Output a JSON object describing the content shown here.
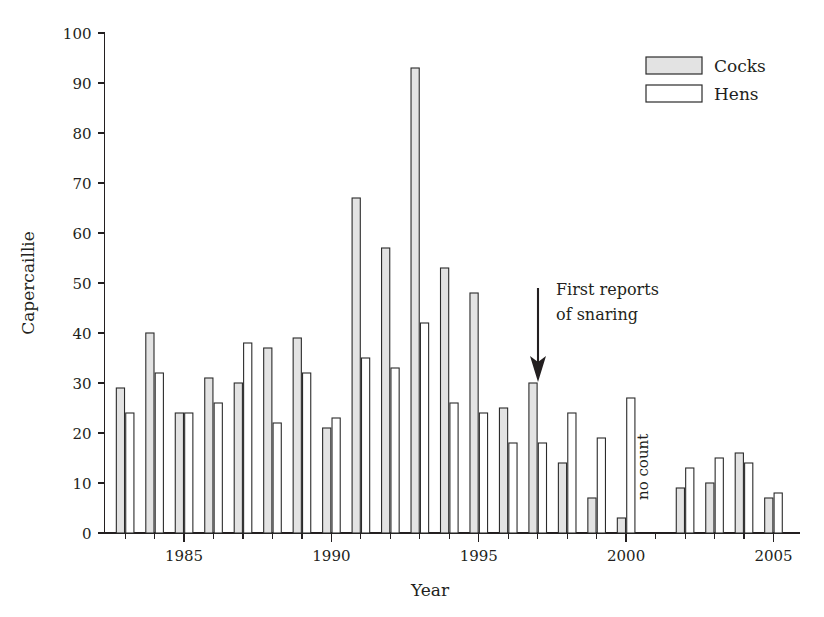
{
  "chart_data": {
    "type": "bar",
    "title": "",
    "xlabel": "Year",
    "ylabel": "Capercaillie",
    "xlim": [
      1982.3,
      2005.9
    ],
    "ylim": [
      0,
      100
    ],
    "grid": false,
    "legend_position": "top-right",
    "ytick_labels": [
      "0",
      "10",
      "20",
      "30",
      "40",
      "50",
      "60",
      "70",
      "80",
      "90",
      "100"
    ],
    "ytick_values": [
      0,
      10,
      20,
      30,
      40,
      50,
      60,
      70,
      80,
      90,
      100
    ],
    "xtick_labels": [
      "1985",
      "1990",
      "1995",
      "2000",
      "2005"
    ],
    "xtick_values": [
      1985,
      1990,
      1995,
      2000,
      2005
    ],
    "xtick_minor_values": [
      1983,
      1984,
      1986,
      1987,
      1988,
      1989,
      1991,
      1992,
      1993,
      1994,
      1996,
      1997,
      1998,
      1999,
      2001,
      2002,
      2003,
      2004
    ],
    "categories": [
      1983,
      1984,
      1985,
      1986,
      1987,
      1988,
      1989,
      1990,
      1991,
      1992,
      1993,
      1994,
      1995,
      1996,
      1997,
      1998,
      1999,
      2000,
      2001,
      2002,
      2003,
      2004,
      2005
    ],
    "series": [
      {
        "name": "Cocks",
        "color": "#e3e3e3",
        "values": [
          29,
          40,
          24,
          31,
          30,
          37,
          39,
          21,
          67,
          57,
          93,
          53,
          48,
          25,
          30,
          14,
          7,
          3,
          null,
          9,
          10,
          16,
          7
        ]
      },
      {
        "name": "Hens",
        "color": "#ffffff",
        "values": [
          24,
          32,
          24,
          26,
          38,
          22,
          32,
          23,
          35,
          33,
          42,
          26,
          24,
          18,
          18,
          24,
          19,
          27,
          null,
          13,
          15,
          14,
          8
        ]
      }
    ],
    "annotations": [
      {
        "name": "snaring-annotation",
        "text_line1": "First reports",
        "text_line2": "of snaring",
        "arrow_year": 1997,
        "arrow_from_value": 50,
        "arrow_to_value": 31
      },
      {
        "name": "no-count-annotation",
        "text": "no count",
        "year": 2001,
        "rotated": true
      }
    ]
  },
  "legend": {
    "items": [
      {
        "label": "Cocks",
        "fill": "#e3e3e3"
      },
      {
        "label": "Hens",
        "fill": "#ffffff"
      }
    ]
  },
  "axes": {
    "y_title": "Capercaillie",
    "x_title": "Year"
  }
}
